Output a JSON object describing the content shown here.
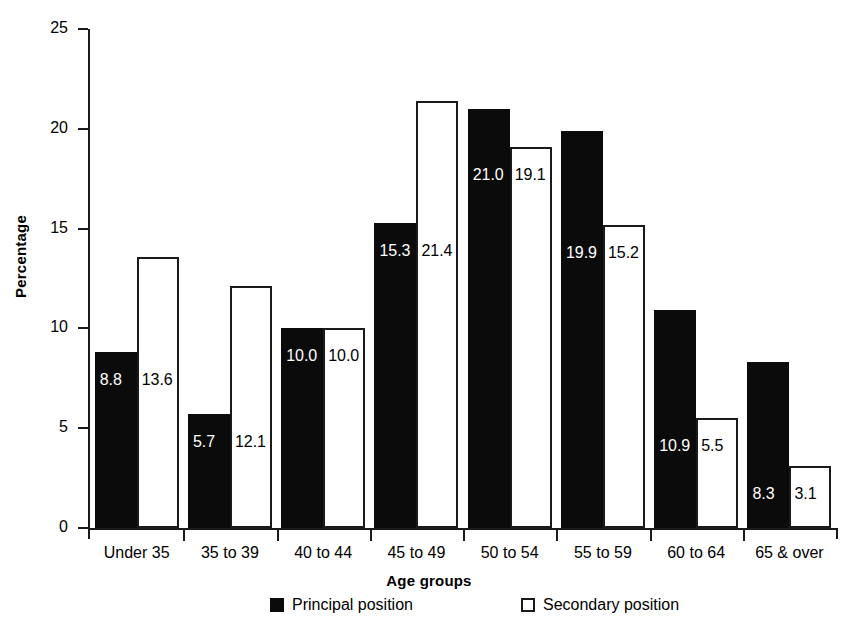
{
  "chart_data": {
    "type": "bar",
    "title": "",
    "xlabel": "Age groups",
    "ylabel": "Percentage",
    "categories": [
      "Under 35",
      "35 to 39",
      "40 to 44",
      "45 to 49",
      "50 to 54",
      "55 to 59",
      "60 to 64",
      "65 & over"
    ],
    "series": [
      {
        "name": "Principal position",
        "color": "#0b0b0b",
        "style": "filled",
        "values": [
          8.8,
          5.7,
          10.0,
          15.3,
          21.0,
          19.9,
          10.9,
          8.3
        ],
        "labels": [
          "8.8",
          "5.7",
          "10.0",
          "15.3",
          "21.0",
          "19.9",
          "10.9",
          "8.3"
        ]
      },
      {
        "name": "Secondary position",
        "color": "#ffffff",
        "style": "hollow",
        "values": [
          13.6,
          12.1,
          10.0,
          21.4,
          19.1,
          15.2,
          5.5,
          3.1
        ],
        "labels": [
          "13.6",
          "12.1",
          "10.0",
          "21.4",
          "19.1",
          "15.2",
          "5.5",
          "3.1"
        ]
      }
    ],
    "ylim": [
      0,
      25
    ],
    "yticks": [
      0,
      5,
      10,
      15,
      20,
      25
    ],
    "ytick_labels": [
      "0",
      "5",
      "10",
      "15",
      "20",
      "25"
    ],
    "grid": false,
    "legend_position": "bottom"
  },
  "legend": {
    "items": [
      {
        "label": "Principal position",
        "marker": "filled-square-icon"
      },
      {
        "label": "Secondary position",
        "marker": "hollow-square-icon"
      }
    ]
  }
}
